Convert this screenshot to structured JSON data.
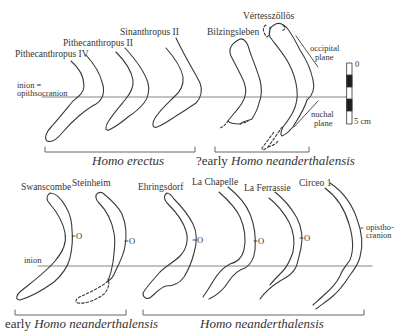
{
  "figure": {
    "top_row": {
      "specimens": [
        {
          "name": "Pithecanthropus IV"
        },
        {
          "name": "Pithecanthropus II"
        },
        {
          "name": "Sinanthropus II"
        },
        {
          "name": "Bilzingsleben"
        },
        {
          "name": "Vértesszöllös"
        }
      ],
      "reference_line_label": {
        "line1": "inion =",
        "line2": "opithsocranion"
      },
      "annotations": {
        "occipital_plane": {
          "line1": "occipital",
          "line2": "plane"
        },
        "nuchal_plane": {
          "line1": "nuchal",
          "line2": "plane"
        }
      },
      "groups": [
        {
          "prefix": "",
          "taxon": "Homo erectus"
        },
        {
          "prefix": "?early ",
          "taxon": "Homo neanderthalensis"
        }
      ]
    },
    "scale_bar": {
      "top_label": "0",
      "bottom_label": "5 cm"
    },
    "bottom_row": {
      "specimens": [
        {
          "name": "Swanscombe"
        },
        {
          "name": "Steinheim"
        },
        {
          "name": "Ehringsdorf"
        },
        {
          "name": "La Chapelle"
        },
        {
          "name": "La Ferrassie"
        },
        {
          "name": "Circeo 1"
        }
      ],
      "reference_line_label": "inion",
      "opisthocranion_marker": "O",
      "annotations": {
        "opisthocranion": {
          "line1": "opistho-",
          "line2": "cranion"
        }
      },
      "groups": [
        {
          "prefix": "early ",
          "taxon": "Homo neanderthalensis"
        },
        {
          "prefix": "",
          "taxon": "Homo neanderthalensis"
        }
      ]
    },
    "colors": {
      "line": "#3a3a3a",
      "reference_line": "#777777",
      "background": "#ffffff"
    }
  }
}
